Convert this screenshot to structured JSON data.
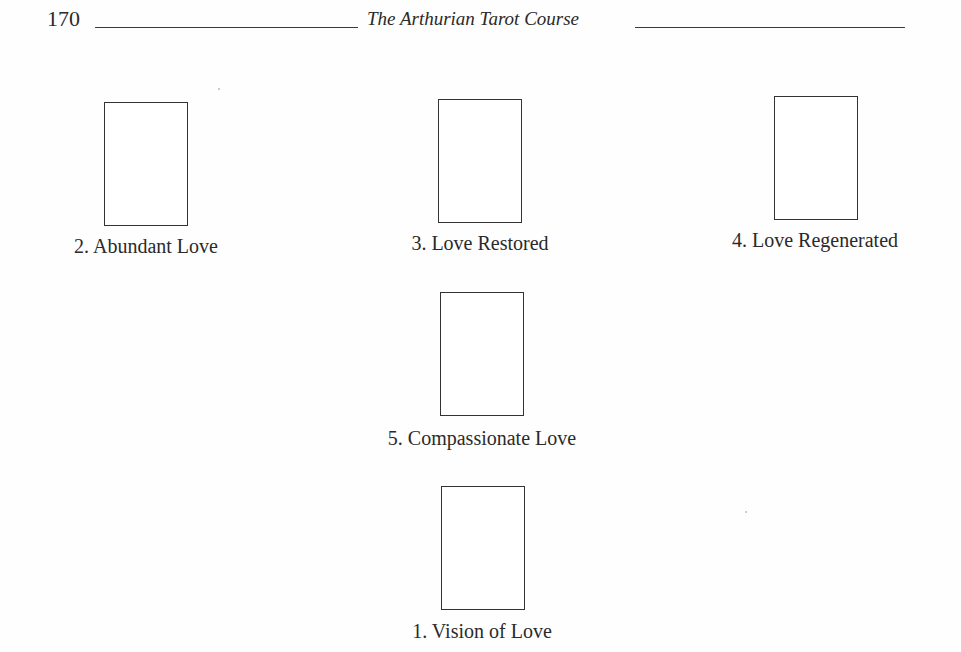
{
  "header": {
    "page_number": "170",
    "running_title": "The Arthurian Tarot Course"
  },
  "spread": {
    "cards": [
      {
        "position": 2,
        "label": "2. Abundant Love"
      },
      {
        "position": 3,
        "label": "3. Love Restored"
      },
      {
        "position": 4,
        "label": "4. Love Regenerated"
      },
      {
        "position": 5,
        "label": "5. Compassionate Love"
      },
      {
        "position": 1,
        "label": "1. Vision of Love"
      }
    ]
  },
  "colors": {
    "ink": "#2a2a2a",
    "card_outline": "#333333",
    "paper": "#fefefe"
  }
}
